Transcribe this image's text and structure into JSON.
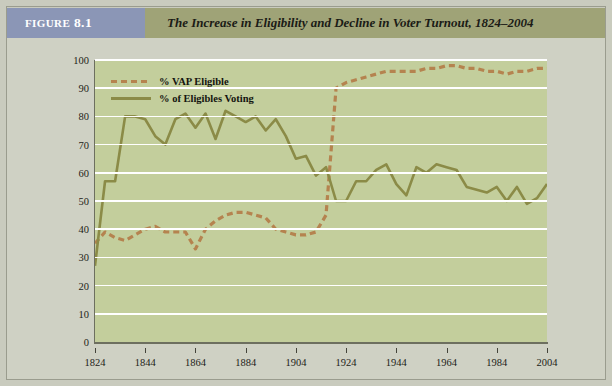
{
  "figure": {
    "tag_prefix": "FIGURE",
    "tag_number": "8.1",
    "title": "The Increase in Eligibility and Decline in Voter Turnout, 1824–2004"
  },
  "legend": {
    "position": "top-left-inside",
    "items": [
      {
        "label": "% VAP Eligible",
        "style": "dashed",
        "color": "#b5834f"
      },
      {
        "label": "% of Eligibles Voting",
        "style": "solid",
        "color": "#8b8b47"
      }
    ]
  },
  "colors": {
    "page_background": "#c9cbbe",
    "panel_background": "#cfd1c4",
    "plot_background": "#c3ce9c",
    "gridline": "#ffffff",
    "figure_tag_background": "#8b96b6",
    "figure_tag_text": "#ffffff",
    "header_background": "#9fa377",
    "header_text": "#1b1b16",
    "axis": "#6d6f5f",
    "vap_eligible": "#b5834f",
    "eligibles_voting": "#8b8b47"
  },
  "chart_data": {
    "type": "line",
    "title": "The Increase in Eligibility and Decline in Voter Turnout, 1824–2004",
    "xlabel": "",
    "ylabel": "",
    "xlim": [
      1824,
      2004
    ],
    "ylim": [
      0,
      100
    ],
    "grid": true,
    "legend_position": "upper left",
    "x_ticks": [
      1824,
      1844,
      1864,
      1884,
      1904,
      1924,
      1944,
      1964,
      1984,
      2004
    ],
    "y_ticks": [
      0,
      10,
      20,
      30,
      40,
      50,
      60,
      70,
      80,
      90,
      100
    ],
    "x": [
      1824,
      1828,
      1832,
      1836,
      1840,
      1844,
      1848,
      1852,
      1856,
      1860,
      1864,
      1868,
      1872,
      1876,
      1880,
      1884,
      1888,
      1892,
      1896,
      1900,
      1904,
      1908,
      1912,
      1916,
      1920,
      1924,
      1928,
      1932,
      1936,
      1940,
      1944,
      1948,
      1952,
      1956,
      1960,
      1964,
      1968,
      1972,
      1976,
      1980,
      1984,
      1988,
      1992,
      1996,
      2000,
      2004
    ],
    "series": [
      {
        "name": "% VAP Eligible",
        "style": "dashed",
        "color": "#b5834f",
        "values": [
          35,
          39,
          37,
          36,
          38,
          40,
          41,
          39,
          39,
          39,
          33,
          40,
          43,
          45,
          46,
          46,
          45,
          44,
          40,
          39,
          38,
          38,
          39,
          45,
          90,
          92,
          93,
          94,
          95,
          96,
          96,
          96,
          96,
          97,
          97,
          98,
          98,
          97,
          97,
          96,
          96,
          95,
          96,
          96,
          97,
          97
        ]
      },
      {
        "name": "% of Eligibles Voting",
        "style": "solid",
        "color": "#8b8b47",
        "values": [
          27,
          57,
          57,
          80,
          80,
          79,
          73,
          70,
          79,
          81,
          76,
          81,
          72,
          82,
          80,
          78,
          80,
          75,
          79,
          73,
          65,
          66,
          59,
          62,
          50,
          50,
          57,
          57,
          61,
          63,
          56,
          52,
          62,
          60,
          63,
          62,
          61,
          55,
          54,
          53,
          55,
          50,
          55,
          49,
          51,
          56
        ]
      }
    ]
  }
}
